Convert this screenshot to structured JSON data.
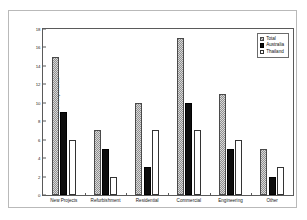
{
  "chart_data": {
    "type": "bar",
    "title": "",
    "subtitle": "",
    "xlabel": "",
    "ylabel": "No. of Respondents",
    "ylim": [
      0,
      18
    ],
    "ytick_step": 2,
    "yticks": [
      0,
      2,
      4,
      6,
      8,
      10,
      12,
      14,
      16,
      18
    ],
    "ytick_labels": [
      "0",
      "2",
      "4",
      "6",
      "8",
      "10",
      "12",
      "14",
      "16",
      "18"
    ],
    "grid": false,
    "legend_position": "top-right",
    "categories": [
      "New Projects",
      "Refurbishment",
      "Residential",
      "Commercial",
      "Engineering",
      "Other"
    ],
    "series": [
      {
        "name": "Total",
        "values": [
          15,
          7,
          10,
          17,
          11,
          5
        ],
        "color": "#8f8f8f",
        "pattern": "checkered-gray"
      },
      {
        "name": "Australia",
        "values": [
          9,
          5,
          3,
          10,
          5,
          2
        ],
        "color": "#0d0d0d",
        "pattern": "solid-black"
      },
      {
        "name": "Thailand",
        "values": [
          6,
          2,
          7,
          7,
          6,
          3
        ],
        "color": "#ffffff",
        "pattern": "open-white"
      }
    ]
  },
  "legend": {
    "items": [
      {
        "label": "Total",
        "swatch": "total"
      },
      {
        "label": "Australia",
        "swatch": "australia"
      },
      {
        "label": "Thailand",
        "swatch": "thailand"
      }
    ]
  }
}
